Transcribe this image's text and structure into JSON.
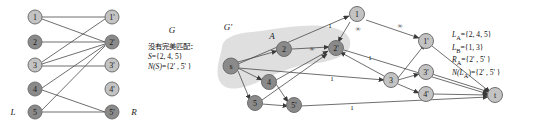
{
  "figure": {
    "title_left": "G",
    "title_right": "G'",
    "region_label_right": "A",
    "side_label_left": "L",
    "side_label_right": "R"
  },
  "left_graph": {
    "type": "bipartite",
    "left_nodes": [
      {
        "id": "1",
        "label": "1",
        "shade": "light"
      },
      {
        "id": "2",
        "label": "2",
        "shade": "dark"
      },
      {
        "id": "3",
        "label": "3",
        "shade": "light"
      },
      {
        "id": "4",
        "label": "4",
        "shade": "dark"
      },
      {
        "id": "5",
        "label": "5",
        "shade": "dark"
      }
    ],
    "right_nodes": [
      {
        "id": "1p",
        "label": "1'",
        "shade": "light"
      },
      {
        "id": "2p",
        "label": "2'",
        "shade": "dark"
      },
      {
        "id": "3p",
        "label": "3'",
        "shade": "light"
      },
      {
        "id": "4p",
        "label": "4'",
        "shade": "light"
      },
      {
        "id": "5p",
        "label": "5'",
        "shade": "dark"
      }
    ],
    "edges": [
      [
        "1",
        "1p"
      ],
      [
        "1",
        "2p"
      ],
      [
        "2",
        "2p"
      ],
      [
        "3",
        "2p"
      ],
      [
        "3",
        "3p"
      ],
      [
        "3",
        "1p"
      ],
      [
        "4",
        "2p"
      ],
      [
        "4",
        "5p"
      ],
      [
        "5",
        "5p"
      ],
      [
        "5",
        "2p"
      ]
    ]
  },
  "left_note": {
    "line1": "没有完美匹配：",
    "line2_lhs": "S",
    "line2_rhs": "={2, 4, 5}",
    "line3_lhs": "N",
    "line3_mid": "(S)",
    "line3_rhs": "={2' , 5' }"
  },
  "right_graph": {
    "type": "flow-network",
    "source": {
      "id": "s",
      "label": "s",
      "shade": "dark"
    },
    "sink": {
      "id": "t",
      "label": "t",
      "shade": "light"
    },
    "left_nodes": [
      {
        "id": "1",
        "label": "1",
        "shade": "light"
      },
      {
        "id": "2",
        "label": "2",
        "shade": "dark"
      },
      {
        "id": "3",
        "label": "3",
        "shade": "light"
      },
      {
        "id": "4",
        "label": "4",
        "shade": "dark"
      },
      {
        "id": "5",
        "label": "5",
        "shade": "dark"
      }
    ],
    "right_nodes": [
      {
        "id": "1p",
        "label": "1'",
        "shade": "light"
      },
      {
        "id": "2p",
        "label": "2'",
        "shade": "dark"
      },
      {
        "id": "3p",
        "label": "3'",
        "shade": "light"
      },
      {
        "id": "4p",
        "label": "4'",
        "shade": "light"
      },
      {
        "id": "5p",
        "label": "5'",
        "shade": "dark"
      }
    ],
    "capacity_labels": [
      {
        "text": "1",
        "x": 330,
        "y": 26
      },
      {
        "text": "∞",
        "x": 358,
        "y": 29
      },
      {
        "text": "∞",
        "x": 400,
        "y": 26
      },
      {
        "text": "∞",
        "x": 312,
        "y": 49
      },
      {
        "text": "1",
        "x": 370,
        "y": 58
      },
      {
        "text": "1",
        "x": 332,
        "y": 79
      },
      {
        "text": "1",
        "x": 352,
        "y": 108
      }
    ]
  },
  "right_note": {
    "line1_lhs": "L",
    "line1_sub": "A",
    "line1_rhs": "={2, 4, 5}",
    "line2_lhs": "L",
    "line2_sub": "B",
    "line2_rhs": "={1, 3}",
    "line3_lhs": "R",
    "line3_sub": "A",
    "line3_rhs": "={2' , 5' }",
    "line4_lhs": "N",
    "line4_mid_lhs": "(L",
    "line4_sub": "A",
    "line4_mid_rhs": ")",
    "line4_rhs": "={2' , 5' }"
  },
  "colors": {
    "node_light": "#c3c3c3",
    "node_dark": "#8a8a8a",
    "node_stroke": "#6f6f6f",
    "edge": "#4a4a4a",
    "region": "#d9d9d9",
    "text": "#111111",
    "background": "#ffffff"
  }
}
